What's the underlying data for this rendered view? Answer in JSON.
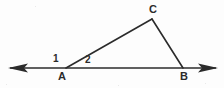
{
  "figure": {
    "kind": "geometry-diagram",
    "background_color": "#fdfdfd",
    "stroke_color": "#2b2b2b",
    "text_color": "#2b2b2b",
    "stroke_width": 1.6,
    "width": 224,
    "height": 88
  },
  "labels": {
    "vertex_a": "A",
    "vertex_b": "B",
    "vertex_c": "C",
    "angle_1": "1",
    "angle_2": "2"
  },
  "geometry": {
    "points": {
      "A": {
        "x": 66,
        "y": 68
      },
      "B": {
        "x": 183,
        "y": 68
      },
      "C": {
        "x": 152,
        "y": 19
      }
    },
    "baseline": {
      "name": "line-through-A-and-B",
      "x1": 10,
      "y1": 68,
      "x2": 216,
      "y2": 68,
      "arrow_left": true,
      "arrow_right": true
    },
    "segments": [
      {
        "name": "segment-AC",
        "from": "A",
        "to": "C"
      },
      {
        "name": "segment-CB",
        "from": "C",
        "to": "B"
      }
    ],
    "angles": [
      {
        "name": "angle-1",
        "label": "1",
        "at": "A",
        "position": "left-above-baseline"
      },
      {
        "name": "angle-2",
        "label": "2",
        "at": "A",
        "position": "right-above-baseline"
      }
    ]
  }
}
